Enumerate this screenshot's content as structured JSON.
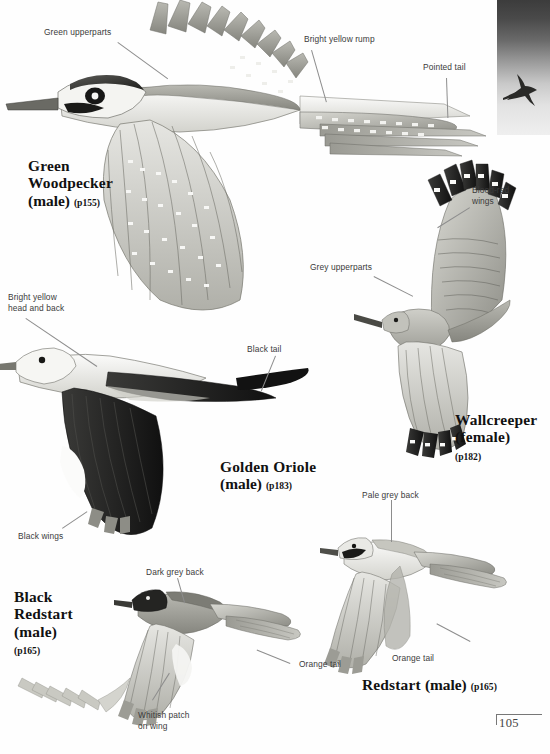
{
  "page": {
    "folio": "105",
    "palette": {
      "ink": "#3b3b3b",
      "leader": "#8d8d8d",
      "caption": "#111111",
      "paper": "#fefefe",
      "thumb_dark": "#3c3c3c",
      "thumb_light": "#efefef"
    }
  },
  "thumbnail": {
    "name": "silhouette-thumbnail",
    "subject": "bird-in-flight-silhouette",
    "background": "vertical grey gradient, dark top to light bottom"
  },
  "species": [
    {
      "id": "green-woodpecker",
      "name": "Green Woodpecker",
      "sex": "(male)",
      "page_ref": "(p155)",
      "lines": [
        "Green",
        "Woodpecker"
      ]
    },
    {
      "id": "wallcreeper",
      "name": "Wallcreeper",
      "sex": "(female)",
      "page_ref": "(p182)",
      "lines": [
        "Wallcreeper"
      ]
    },
    {
      "id": "golden-oriole",
      "name": "Golden Oriole",
      "sex": "(male)",
      "page_ref": "(p183)",
      "lines": [
        "Golden Oriole"
      ]
    },
    {
      "id": "black-redstart",
      "name": "Black Redstart",
      "sex": "(male)",
      "page_ref": "(p165)",
      "lines": [
        "Black",
        "Redstart"
      ]
    },
    {
      "id": "redstart",
      "name": "Redstart",
      "sex": "(male)",
      "page_ref": "(p165)",
      "lines": [
        "Redstart"
      ]
    }
  ],
  "annotations": [
    {
      "id": "green-upperparts",
      "text": "Green upperparts",
      "species": "green-woodpecker"
    },
    {
      "id": "bright-yellow-rump",
      "text": "Bright yellow rump",
      "species": "green-woodpecker"
    },
    {
      "id": "pointed-tail",
      "text": "Pointed tail",
      "species": "green-woodpecker"
    },
    {
      "id": "blood-red-wings",
      "text": "Blood-red\nwings",
      "species": "wallcreeper"
    },
    {
      "id": "grey-upperparts",
      "text": "Grey upperparts",
      "species": "wallcreeper"
    },
    {
      "id": "bright-yellow-head-back",
      "text": "Bright yellow\nhead and back",
      "species": "golden-oriole"
    },
    {
      "id": "black-tail",
      "text": "Black tail",
      "species": "golden-oriole"
    },
    {
      "id": "black-wings",
      "text": "Black wings",
      "species": "golden-oriole"
    },
    {
      "id": "pale-grey-back",
      "text": "Pale grey back",
      "species": "redstart"
    },
    {
      "id": "orange-tail-redstart",
      "text": "Orange tail",
      "species": "redstart"
    },
    {
      "id": "dark-grey-back",
      "text": "Dark grey back",
      "species": "black-redstart"
    },
    {
      "id": "orange-tail-black-redstart",
      "text": "Orange tail",
      "species": "black-redstart"
    },
    {
      "id": "whitish-patch-on-wing",
      "text": "Whitish patch\non wing",
      "species": "black-redstart"
    }
  ]
}
